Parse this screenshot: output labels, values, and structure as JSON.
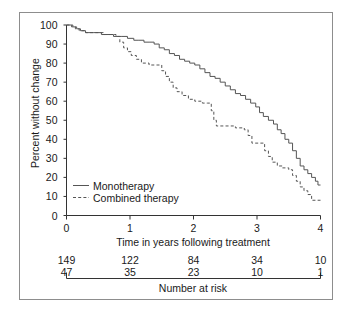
{
  "chart_data": {
    "type": "line",
    "title": "",
    "xlabel": "Time in years following treatment",
    "ylabel": "Percent without change",
    "xlim": [
      0,
      4
    ],
    "ylim": [
      0,
      100
    ],
    "xticks": [
      "0",
      "1",
      "2",
      "3",
      "4"
    ],
    "yticks": [
      "0",
      "10",
      "20",
      "30",
      "40",
      "50",
      "60",
      "70",
      "80",
      "90",
      "100"
    ],
    "grid": false,
    "legend_position": "lower-left-inside",
    "series": [
      {
        "name": "Monotherapy",
        "style": "solid",
        "color": "#555555",
        "steps": [
          [
            0.0,
            100
          ],
          [
            0.1,
            99
          ],
          [
            0.16,
            98
          ],
          [
            0.22,
            97
          ],
          [
            0.3,
            96
          ],
          [
            0.42,
            96
          ],
          [
            0.55,
            95
          ],
          [
            0.62,
            95
          ],
          [
            0.74,
            94
          ],
          [
            0.86,
            94
          ],
          [
            0.96,
            93
          ],
          [
            1.06,
            92
          ],
          [
            1.14,
            92
          ],
          [
            1.22,
            91
          ],
          [
            1.3,
            91
          ],
          [
            1.38,
            90
          ],
          [
            1.46,
            88
          ],
          [
            1.54,
            87
          ],
          [
            1.62,
            85
          ],
          [
            1.7,
            84
          ],
          [
            1.78,
            82
          ],
          [
            1.86,
            81
          ],
          [
            1.94,
            80
          ],
          [
            2.02,
            79
          ],
          [
            2.1,
            77
          ],
          [
            2.18,
            75
          ],
          [
            2.26,
            73
          ],
          [
            2.34,
            72
          ],
          [
            2.42,
            70
          ],
          [
            2.5,
            68
          ],
          [
            2.58,
            66
          ],
          [
            2.66,
            64
          ],
          [
            2.74,
            63
          ],
          [
            2.82,
            61
          ],
          [
            2.9,
            59
          ],
          [
            2.98,
            57
          ],
          [
            3.04,
            54
          ],
          [
            3.1,
            52
          ],
          [
            3.18,
            50
          ],
          [
            3.26,
            48
          ],
          [
            3.32,
            45
          ],
          [
            3.38,
            43
          ],
          [
            3.44,
            40
          ],
          [
            3.5,
            38
          ],
          [
            3.56,
            34
          ],
          [
            3.62,
            30
          ],
          [
            3.68,
            26
          ],
          [
            3.74,
            24
          ],
          [
            3.8,
            22
          ],
          [
            3.86,
            20
          ],
          [
            3.92,
            18
          ],
          [
            3.96,
            16
          ],
          [
            4.0,
            16
          ]
        ],
        "final_value": 16
      },
      {
        "name": "Combined therapy",
        "style": "dashed",
        "color": "#555555",
        "steps": [
          [
            0.0,
            100
          ],
          [
            0.08,
            99
          ],
          [
            0.14,
            98
          ],
          [
            0.2,
            97
          ],
          [
            0.3,
            96
          ],
          [
            0.44,
            96
          ],
          [
            0.58,
            95
          ],
          [
            0.7,
            95
          ],
          [
            0.78,
            94
          ],
          [
            0.84,
            91
          ],
          [
            0.9,
            88
          ],
          [
            0.96,
            86
          ],
          [
            1.02,
            84
          ],
          [
            1.1,
            82
          ],
          [
            1.18,
            80
          ],
          [
            1.3,
            79
          ],
          [
            1.44,
            79
          ],
          [
            1.5,
            76
          ],
          [
            1.56,
            73
          ],
          [
            1.62,
            70
          ],
          [
            1.68,
            67
          ],
          [
            1.74,
            65
          ],
          [
            1.82,
            63
          ],
          [
            1.92,
            61
          ],
          [
            2.02,
            60
          ],
          [
            2.14,
            59
          ],
          [
            2.22,
            59
          ],
          [
            2.28,
            55
          ],
          [
            2.32,
            50
          ],
          [
            2.36,
            47
          ],
          [
            2.5,
            47
          ],
          [
            2.66,
            46
          ],
          [
            2.8,
            45
          ],
          [
            2.86,
            42
          ],
          [
            2.92,
            38
          ],
          [
            3.04,
            38
          ],
          [
            3.12,
            34
          ],
          [
            3.18,
            31
          ],
          [
            3.24,
            28
          ],
          [
            3.32,
            26
          ],
          [
            3.4,
            25
          ],
          [
            3.5,
            24
          ],
          [
            3.56,
            21
          ],
          [
            3.62,
            18
          ],
          [
            3.68,
            15
          ],
          [
            3.74,
            13
          ],
          [
            3.8,
            11
          ],
          [
            3.86,
            8
          ],
          [
            4.0,
            8
          ]
        ],
        "final_value": 8
      }
    ]
  },
  "legend": {
    "items": [
      {
        "label": "Monotherapy",
        "style": "solid"
      },
      {
        "label": "Combined therapy",
        "style": "dashed"
      }
    ]
  },
  "risk_table": {
    "caption": "Number at risk",
    "times": [
      "0",
      "1",
      "2",
      "3",
      "4"
    ],
    "rows": [
      {
        "series": "Monotherapy",
        "values": [
          "149",
          "122",
          "84",
          "34",
          "10"
        ]
      },
      {
        "series": "Combined therapy",
        "values": [
          "47",
          "35",
          "23",
          "10",
          "1"
        ]
      }
    ]
  }
}
